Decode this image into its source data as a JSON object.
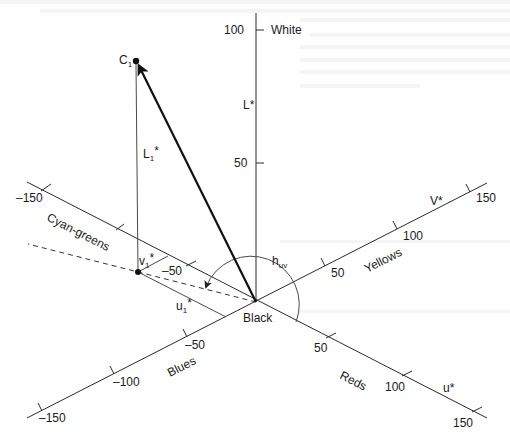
{
  "figure": {
    "type": "CIELUV color space diagram",
    "origin_label": "Black",
    "colors": {
      "ink": "#1a1a1a",
      "background": "#ffffff"
    }
  },
  "axes": {
    "lightness": {
      "label": "L*",
      "top_label": "White",
      "ticks": [
        {
          "value": 100,
          "label": "100"
        },
        {
          "value": 50,
          "label": "50"
        }
      ]
    },
    "v_axis": {
      "label": "V*",
      "positive_region": "Yellows",
      "negative_region": "Blues",
      "ticks": [
        {
          "value": 50,
          "label": "50"
        },
        {
          "value": 100,
          "label": "100"
        },
        {
          "value": 150,
          "label": "150"
        },
        {
          "value": -50,
          "label": "–50"
        },
        {
          "value": -100,
          "label": "–100"
        },
        {
          "value": -150,
          "label": "–150"
        }
      ]
    },
    "u_axis": {
      "label": "u*",
      "positive_region": "Reds",
      "negative_region": "Cyan-greens",
      "ticks": [
        {
          "value": 50,
          "label": "50"
        },
        {
          "value": 100,
          "label": "100"
        },
        {
          "value": 150,
          "label": "150"
        },
        {
          "value": -50,
          "label": "–50"
        },
        {
          "value": -150,
          "label": "–150"
        }
      ]
    }
  },
  "point": {
    "label": "C",
    "label_sub": "1",
    "lightness_label": "L",
    "lightness_sub": "1",
    "lightness_sup": "*",
    "v_label": "v",
    "v_sub": "1",
    "v_sup": "*",
    "u_label": "u",
    "u_sub": "1",
    "u_sup": "*"
  },
  "hue_angle": {
    "label": "h",
    "label_sub": "uv"
  }
}
